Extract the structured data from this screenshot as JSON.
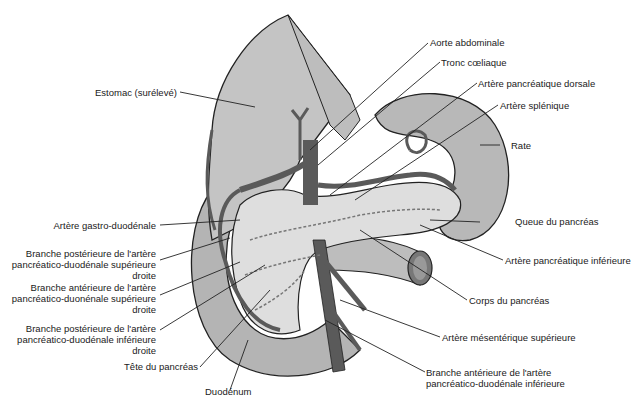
{
  "diagram": {
    "colors": {
      "organ_light": "#c9c9c9",
      "organ_mid": "#b4b4b4",
      "pancreas": "#dcdcdc",
      "artery": "#5a5a5a",
      "outline": "#222222",
      "background": "#ffffff"
    },
    "labels": {
      "estomac": "Estomac (surélevé)",
      "aorte": "Aorte abdominale",
      "tronc": "Tronc cœliaque",
      "pancreatique_dorsale": "Artère pancréatique dorsale",
      "splenique": "Artère splénique",
      "rate": "Rate",
      "gastro_duodenale": "Artère gastro-duodénale",
      "branche_post_sup": [
        "Branche postérieure de l'artère",
        "pancréatico-duodénale supérieure",
        "droite"
      ],
      "branche_ant_sup": [
        "Branche antérieure de l'artère",
        "pancréatico-duonénale supérieure",
        "droite"
      ],
      "branche_post_inf": [
        "Branche postérieure de l'artère",
        "pancréatico-duodénale inférieure",
        "droite"
      ],
      "tete": "Tête du pancréas",
      "duodenum": "Duodénum",
      "queue": "Queue du pancréas",
      "pancreatique_inferieure": "Artère pancréatique inférieure",
      "corps": "Corps du pancréas",
      "mesenterique": "Artère mésentérique supérieure",
      "branche_ant_inf": [
        "Branche antérieure de l'artère",
        "pancréatico-duodénale inférieure"
      ]
    }
  }
}
